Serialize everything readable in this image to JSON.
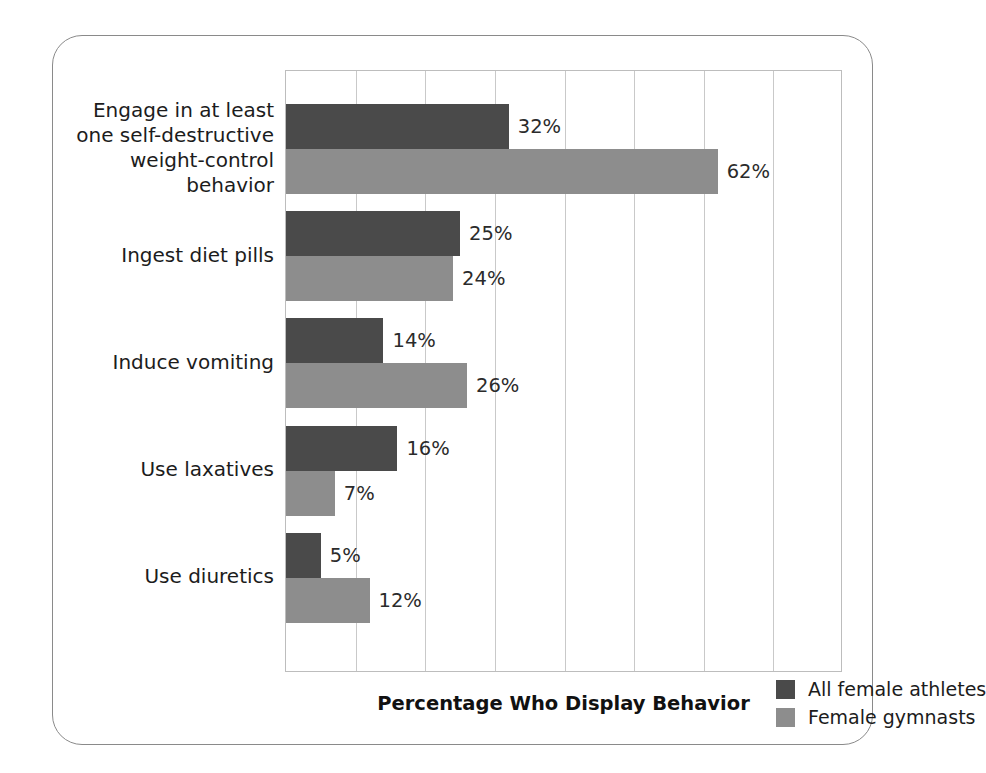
{
  "chart_data": {
    "type": "bar",
    "orientation": "horizontal",
    "title": "",
    "xlabel": "Percentage Who Display Behavior",
    "ylabel": "",
    "xlim": [
      0,
      80
    ],
    "xtick_interval": 10,
    "xtick_labels_visible": false,
    "grid": "vertical",
    "legend_position": "inside-bottom-right",
    "value_label_suffix": "%",
    "categories": [
      "Engage in at least one self-destructive weight-control behavior",
      "Ingest diet pills",
      "Induce vomiting",
      "Use laxatives",
      "Use diuretics"
    ],
    "category_lines": [
      [
        "Engage in at least",
        "one self-destructive",
        "weight-control",
        "behavior"
      ],
      [
        "Ingest diet pills"
      ],
      [
        "Induce vomiting"
      ],
      [
        "Use laxatives"
      ],
      [
        "Use diuretics"
      ]
    ],
    "series": [
      {
        "name": "All female athletes",
        "color": "#4a4a4a",
        "values": [
          32,
          25,
          14,
          16,
          5
        ],
        "value_labels": [
          "32%",
          "25%",
          "14%",
          "16%",
          "5%"
        ]
      },
      {
        "name": "Female gymnasts",
        "color": "#8d8d8d",
        "values": [
          62,
          24,
          26,
          7,
          12
        ],
        "value_labels": [
          "62%",
          "24%",
          "26%",
          "7%",
          "12%"
        ]
      }
    ]
  },
  "figure": {
    "frame_color": "#8a8a8a",
    "plot_border_color": "#bdbdbd",
    "gridline_color": "#c9c9c9",
    "background": "#ffffff"
  }
}
